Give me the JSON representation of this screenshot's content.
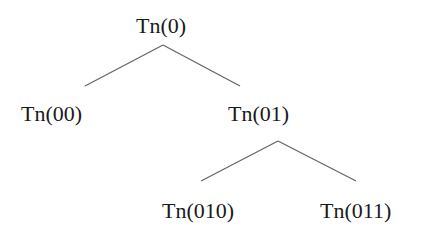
{
  "diagram": {
    "type": "binary-tree",
    "line_color": "#666666",
    "text_color": "#1a1a1a",
    "nodes": [
      {
        "id": "0",
        "label": "Tn(0)",
        "x": 136,
        "y": 14
      },
      {
        "id": "00",
        "label": "Tn(00)",
        "x": 21,
        "y": 102
      },
      {
        "id": "01",
        "label": "Tn(01)",
        "x": 228,
        "y": 102
      },
      {
        "id": "010",
        "label": "Tn(010)",
        "x": 162,
        "y": 199
      },
      {
        "id": "011",
        "label": "Tn(011)",
        "x": 320,
        "y": 199
      }
    ],
    "edges": [
      {
        "from": "0",
        "to": "00",
        "x1": 163,
        "y1": 45,
        "x2": 85,
        "y2": 86
      },
      {
        "from": "0",
        "to": "01",
        "x1": 163,
        "y1": 45,
        "x2": 240,
        "y2": 86
      },
      {
        "from": "01",
        "to": "010",
        "x1": 278,
        "y1": 141,
        "x2": 201,
        "y2": 181
      },
      {
        "from": "01",
        "to": "011",
        "x1": 278,
        "y1": 141,
        "x2": 356,
        "y2": 181
      }
    ]
  }
}
